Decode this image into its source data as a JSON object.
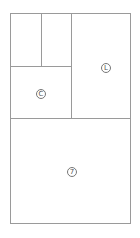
{
  "diagram": {
    "type": "floor-plan-partition",
    "regions": [
      {
        "id": "top-left-a"
      },
      {
        "id": "top-left-b"
      },
      {
        "id": "mid-left",
        "icon": {
          "name": "circle-c-icon",
          "glyph": "C"
        }
      },
      {
        "id": "top-right",
        "icon": {
          "name": "circle-l-icon",
          "glyph": "L"
        }
      },
      {
        "id": "bottom",
        "icon": {
          "name": "circle-7-icon",
          "glyph": "7"
        }
      }
    ],
    "stroke_color": "#9a9a9a"
  }
}
